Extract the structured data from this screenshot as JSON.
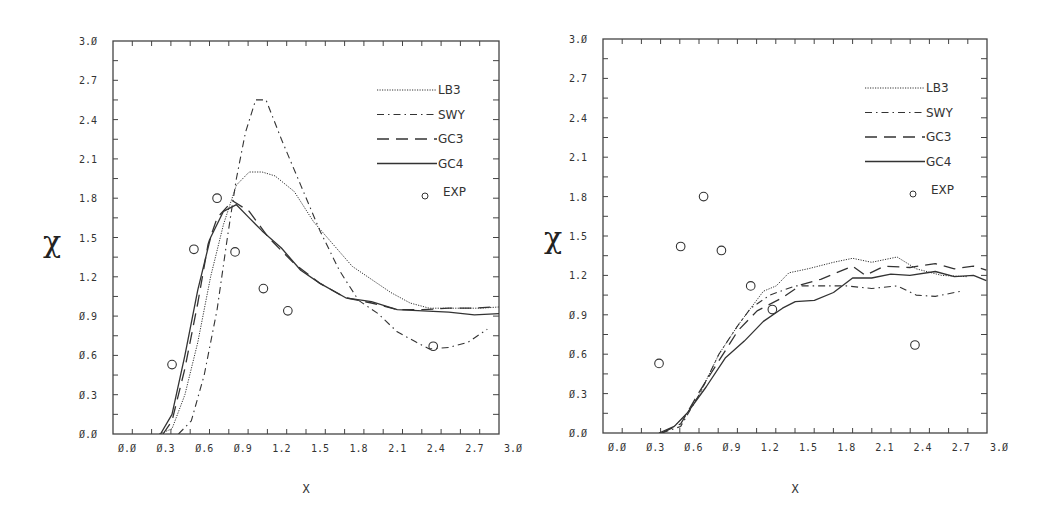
{
  "chart_data": [
    {
      "type": "line",
      "title": "",
      "xlabel": "X",
      "ylabel": "χ",
      "xlim": [
        -0.1,
        2.9
      ],
      "ylim": [
        0.0,
        3.0
      ],
      "x_ticks": [
        "0.0",
        "0.3",
        "0.6",
        "0.9",
        "1.2",
        "1.5",
        "1.8",
        "2.1",
        "2.4",
        "2.7",
        "3.0"
      ],
      "y_ticks": [
        "0.0",
        "0.3",
        "0.6",
        "0.9",
        "1.2",
        "1.5",
        "1.8",
        "2.1",
        "2.4",
        "2.7",
        "3.0"
      ],
      "grid": false,
      "legend_position": "upper right",
      "series": [
        {
          "name": "LB3",
          "style": "dotted",
          "points": [
            [
              0.25,
              0
            ],
            [
              0.35,
              0.04
            ],
            [
              0.45,
              0.3
            ],
            [
              0.55,
              0.7
            ],
            [
              0.65,
              1.2
            ],
            [
              0.75,
              1.6
            ],
            [
              0.85,
              1.9
            ],
            [
              0.95,
              2.0
            ],
            [
              1.05,
              2.0
            ],
            [
              1.15,
              1.97
            ],
            [
              1.3,
              1.85
            ],
            [
              1.45,
              1.62
            ],
            [
              1.6,
              1.45
            ],
            [
              1.75,
              1.28
            ],
            [
              1.9,
              1.18
            ],
            [
              2.05,
              1.08
            ],
            [
              2.2,
              1.0
            ],
            [
              2.35,
              0.96
            ],
            [
              2.55,
              0.96
            ],
            [
              2.75,
              0.96
            ],
            [
              2.9,
              0.97
            ]
          ]
        },
        {
          "name": "SWY",
          "style": "dash-dot",
          "points": [
            [
              0.4,
              0
            ],
            [
              0.5,
              0.1
            ],
            [
              0.6,
              0.45
            ],
            [
              0.7,
              0.95
            ],
            [
              0.78,
              1.5
            ],
            [
              0.85,
              1.95
            ],
            [
              0.92,
              2.3
            ],
            [
              1.0,
              2.55
            ],
            [
              1.08,
              2.55
            ],
            [
              1.2,
              2.25
            ],
            [
              1.35,
              1.9
            ],
            [
              1.5,
              1.55
            ],
            [
              1.65,
              1.25
            ],
            [
              1.8,
              1.02
            ],
            [
              1.95,
              0.92
            ],
            [
              2.1,
              0.78
            ],
            [
              2.25,
              0.7
            ],
            [
              2.35,
              0.65
            ],
            [
              2.5,
              0.66
            ],
            [
              2.65,
              0.7
            ],
            [
              2.8,
              0.8
            ]
          ]
        },
        {
          "name": "GC3",
          "style": "dashed",
          "points": [
            [
              0.28,
              0
            ],
            [
              0.35,
              0.1
            ],
            [
              0.45,
              0.5
            ],
            [
              0.55,
              1.0
            ],
            [
              0.63,
              1.45
            ],
            [
              0.7,
              1.65
            ],
            [
              0.82,
              1.78
            ],
            [
              0.95,
              1.7
            ],
            [
              1.1,
              1.5
            ],
            [
              1.3,
              1.3
            ],
            [
              1.5,
              1.15
            ],
            [
              1.7,
              1.04
            ],
            [
              1.9,
              1.0
            ],
            [
              2.1,
              0.95
            ],
            [
              2.3,
              0.95
            ],
            [
              2.5,
              0.96
            ],
            [
              2.7,
              0.96
            ],
            [
              2.85,
              0.97
            ]
          ]
        },
        {
          "name": "GC4",
          "style": "solid",
          "points": [
            [
              0.26,
              0
            ],
            [
              0.35,
              0.15
            ],
            [
              0.45,
              0.6
            ],
            [
              0.55,
              1.1
            ],
            [
              0.65,
              1.5
            ],
            [
              0.75,
              1.7
            ],
            [
              0.85,
              1.75
            ],
            [
              0.95,
              1.65
            ],
            [
              1.05,
              1.55
            ],
            [
              1.2,
              1.42
            ],
            [
              1.35,
              1.25
            ],
            [
              1.5,
              1.15
            ],
            [
              1.7,
              1.04
            ],
            [
              1.9,
              1.01
            ],
            [
              2.1,
              0.95
            ],
            [
              2.3,
              0.94
            ],
            [
              2.5,
              0.93
            ],
            [
              2.7,
              0.91
            ],
            [
              2.9,
              0.92
            ]
          ]
        },
        {
          "name": "EXP",
          "style": "circle",
          "points": [
            [
              0.35,
              0.53
            ],
            [
              0.52,
              1.41
            ],
            [
              0.7,
              1.8
            ],
            [
              0.84,
              1.39
            ],
            [
              1.06,
              1.11
            ],
            [
              1.25,
              0.94
            ],
            [
              2.38,
              0.67
            ]
          ]
        }
      ]
    },
    {
      "type": "line",
      "title": "",
      "xlabel": "X",
      "ylabel": "χ",
      "xlim": [
        -0.1,
        2.9
      ],
      "ylim": [
        0.0,
        3.0
      ],
      "x_ticks": [
        "0.0",
        "0.3",
        "0.6",
        "0.9",
        "1.2",
        "1.5",
        "1.8",
        "2.1",
        "2.4",
        "2.7",
        "3.0"
      ],
      "y_ticks": [
        "0.0",
        "0.3",
        "0.6",
        "0.9",
        "1.2",
        "1.5",
        "1.8",
        "2.1",
        "2.4",
        "2.7",
        "3.0"
      ],
      "grid": false,
      "legend_position": "upper right",
      "series": [
        {
          "name": "LB3",
          "style": "dotted",
          "points": [
            [
              0.35,
              0
            ],
            [
              0.45,
              0.05
            ],
            [
              0.55,
              0.15
            ],
            [
              0.65,
              0.3
            ],
            [
              0.8,
              0.6
            ],
            [
              0.95,
              0.82
            ],
            [
              1.05,
              0.95
            ],
            [
              1.15,
              1.08
            ],
            [
              1.25,
              1.12
            ],
            [
              1.35,
              1.22
            ],
            [
              1.5,
              1.25
            ],
            [
              1.7,
              1.3
            ],
            [
              1.85,
              1.33
            ],
            [
              2.0,
              1.3
            ],
            [
              2.2,
              1.34
            ],
            [
              2.35,
              1.25
            ],
            [
              2.55,
              1.2
            ],
            [
              2.75,
              1.19
            ]
          ]
        },
        {
          "name": "SWY",
          "style": "dash-dot",
          "points": [
            [
              0.35,
              0
            ],
            [
              0.5,
              0.05
            ],
            [
              0.65,
              0.3
            ],
            [
              0.8,
              0.6
            ],
            [
              0.95,
              0.82
            ],
            [
              1.05,
              0.95
            ],
            [
              1.2,
              1.05
            ],
            [
              1.4,
              1.12
            ],
            [
              1.6,
              1.12
            ],
            [
              1.8,
              1.12
            ],
            [
              2.0,
              1.1
            ],
            [
              2.2,
              1.12
            ],
            [
              2.35,
              1.05
            ],
            [
              2.5,
              1.04
            ],
            [
              2.7,
              1.08
            ]
          ]
        },
        {
          "name": "GC3",
          "style": "dashed",
          "points": [
            [
              0.35,
              0
            ],
            [
              0.5,
              0.07
            ],
            [
              0.65,
              0.32
            ],
            [
              0.8,
              0.55
            ],
            [
              0.95,
              0.78
            ],
            [
              1.1,
              0.93
            ],
            [
              1.3,
              1.03
            ],
            [
              1.45,
              1.13
            ],
            [
              1.6,
              1.17
            ],
            [
              1.85,
              1.27
            ],
            [
              1.95,
              1.2
            ],
            [
              2.1,
              1.27
            ],
            [
              2.3,
              1.26
            ],
            [
              2.5,
              1.29
            ],
            [
              2.65,
              1.25
            ],
            [
              2.8,
              1.27
            ],
            [
              2.9,
              1.24
            ]
          ]
        },
        {
          "name": "GC4",
          "style": "solid",
          "points": [
            [
              0.33,
              0
            ],
            [
              0.45,
              0.05
            ],
            [
              0.55,
              0.15
            ],
            [
              0.7,
              0.35
            ],
            [
              0.85,
              0.57
            ],
            [
              1.0,
              0.7
            ],
            [
              1.15,
              0.85
            ],
            [
              1.3,
              0.95
            ],
            [
              1.4,
              1.0
            ],
            [
              1.55,
              1.01
            ],
            [
              1.7,
              1.07
            ],
            [
              1.85,
              1.18
            ],
            [
              2.0,
              1.18
            ],
            [
              2.15,
              1.21
            ],
            [
              2.3,
              1.2
            ],
            [
              2.5,
              1.23
            ],
            [
              2.65,
              1.19
            ],
            [
              2.8,
              1.2
            ],
            [
              2.9,
              1.16
            ]
          ]
        },
        {
          "name": "EXP",
          "style": "circle",
          "points": [
            [
              0.33,
              0.53
            ],
            [
              0.5,
              1.42
            ],
            [
              0.68,
              1.8
            ],
            [
              0.82,
              1.39
            ],
            [
              1.05,
              1.12
            ],
            [
              1.22,
              0.94
            ],
            [
              2.34,
              0.67
            ]
          ]
        }
      ]
    }
  ],
  "panels": [
    {
      "frame": {
        "left": 113,
        "top": 41,
        "right": 499,
        "bottom": 434
      },
      "x_zero_px": 127,
      "x_px_per_0_3": 38.6,
      "ylabel_pos": [
        52,
        252
      ],
      "xlabel_pos": [
        306,
        493
      ]
    },
    {
      "frame": {
        "left": 603,
        "top": 39,
        "right": 987,
        "bottom": 433
      },
      "x_zero_px": 617,
      "x_px_per_0_3": 38.2,
      "ylabel_pos": [
        553,
        248
      ],
      "xlabel_pos": [
        795,
        493
      ]
    }
  ],
  "legend": {
    "labels": [
      "LB3",
      "SWY",
      "GC3",
      "GC4",
      "EXP"
    ]
  }
}
